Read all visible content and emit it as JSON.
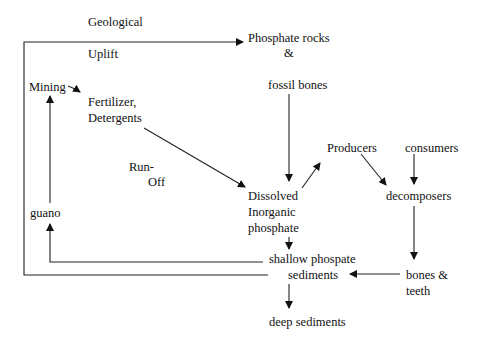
{
  "nodes": {
    "geological": "Geological",
    "uplift": "Uplift",
    "phosphate_rocks": "Phosphate  rocks",
    "ampersand": "&",
    "fossil_bones": "fossil bones",
    "mining": "Mining",
    "fertilizer": "Fertilizer,",
    "detergents": "Detergents",
    "run": "Run-",
    "off": "Off",
    "producers": "Producers",
    "consumers": "consumers",
    "decomposers": "decomposers",
    "dissolved": "Dissolved",
    "inorganic": "Inorganic",
    "phosphate": "phosphate",
    "guano": "guano",
    "shallow": "shallow phospate",
    "sediments": "sediments",
    "bones": "bones &",
    "teeth": "teeth",
    "deep_sediments": "deep sediments"
  },
  "edges": [
    {
      "from": "sediments",
      "to": "phosphate_rocks",
      "label": "Geological Uplift"
    },
    {
      "from": "mining",
      "to": "fertilizer"
    },
    {
      "from": "fertilizer",
      "to": "dissolved_inorganic_phosphate",
      "label": "Run-Off"
    },
    {
      "from": "fossil_bones",
      "to": "dissolved_inorganic_phosphate"
    },
    {
      "from": "dissolved_inorganic_phosphate",
      "to": "producers"
    },
    {
      "from": "producers",
      "to": "decomposers"
    },
    {
      "from": "consumers",
      "to": "decomposers"
    },
    {
      "from": "decomposers",
      "to": "bones_teeth"
    },
    {
      "from": "bones_teeth",
      "to": "sediments"
    },
    {
      "from": "dissolved_inorganic_phosphate",
      "to": "shallow_phospate_sediments"
    },
    {
      "from": "shallow_phospate_sediments",
      "to": "guano"
    },
    {
      "from": "guano",
      "to": "mining"
    },
    {
      "from": "sediments",
      "to": "deep_sediments"
    }
  ]
}
